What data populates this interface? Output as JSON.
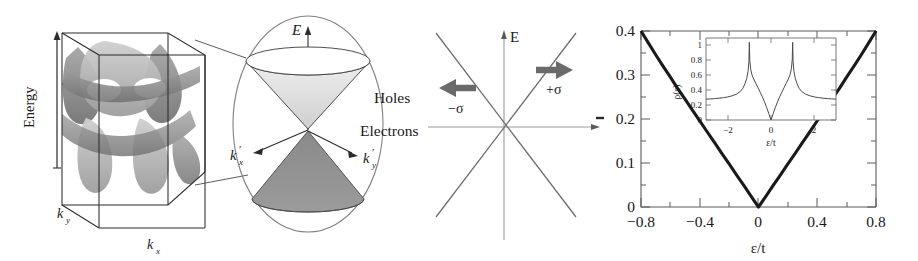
{
  "figure": {
    "panels": [
      {
        "id": "brillouin-zone",
        "axis_energy": "Energy",
        "axis_kx": "k",
        "axis_kx_sub": "x",
        "axis_ky": "k",
        "axis_ky_sub": "y"
      },
      {
        "id": "dirac-cone",
        "axis_E": "E",
        "label_holes": "Holes",
        "label_electrons": "Electrons",
        "axis_kxp": "k",
        "axis_kxp_sup": "'",
        "axis_kxp_sub": "x",
        "axis_kyp": "k",
        "axis_kyp_sup": "'",
        "axis_kyp_sub": "y"
      },
      {
        "id": "dirac-dispersion",
        "axis_E": "E",
        "label_plus_sigma": "+σ",
        "label_minus_sigma": "−σ"
      },
      {
        "id": "density-of-states"
      }
    ]
  },
  "panel_bz": {
    "energy_label": "Energy",
    "kx_label": "k",
    "kx_sub": "x",
    "ky_label": "k",
    "ky_sub": "y",
    "surface_fill_light": "#b9b9b9",
    "surface_fill_dark": "#8a8a8a",
    "box_stroke": "#2b2b2b"
  },
  "panel_cone": {
    "E_label": "E",
    "holes_label": "Holes",
    "electrons_label": "Electrons",
    "kxp_label": "k",
    "kxp_sup": "′",
    "kxp_sub": "x",
    "kyp_label": "k",
    "kyp_sup": "′",
    "kyp_sub": "y",
    "upper_cone_fill": "#dcdcdc",
    "lower_cone_fill": "#8d8d8d",
    "ellipse_stroke": "#777777"
  },
  "panel_dirac": {
    "E_label": "E",
    "plus_sigma_label": "+σ",
    "minus_sigma_label": "−σ",
    "arrow_fill": "#6a6a6a",
    "band_stroke": "#6f6f6f",
    "axis_stroke": "#9a9a9a"
  },
  "panel_dos": {
    "xlabel": "ε/t",
    "ylabel_clipped": "–",
    "x_ticks": [
      "−0.8",
      "−0.4",
      "0",
      "0.4",
      "0.8"
    ],
    "y_ticks": [
      "0",
      "0.1",
      "0.2",
      "0.3",
      "0.4"
    ],
    "inset": {
      "xlabel": "ε/t",
      "ylabel": "ρ(ε)",
      "x_ticks": [
        "−2",
        "0",
        "2"
      ],
      "y_ticks": [
        "0",
        "0.2",
        "0.4",
        "0.6",
        "0.8",
        "1"
      ]
    }
  },
  "chart_data": [
    {
      "type": "line",
      "id": "dos-main",
      "title": "",
      "xlabel": "ε/t",
      "ylabel": "ρ(ε)",
      "xlim": [
        -0.8,
        0.8
      ],
      "ylim": [
        0.0,
        0.4
      ],
      "xticks": [
        -0.8,
        -0.4,
        0,
        0.4,
        0.8
      ],
      "yticks": [
        0,
        0.1,
        0.2,
        0.3,
        0.4
      ],
      "grid": false,
      "legend": "none",
      "series": [
        {
          "name": "ρ(ε) linear Dirac DOS",
          "x": [
            -0.8,
            -0.75,
            -0.7,
            -0.65,
            -0.6,
            -0.55,
            -0.5,
            -0.45,
            -0.4,
            -0.35,
            -0.3,
            -0.25,
            -0.2,
            -0.15,
            -0.1,
            -0.05,
            0.0,
            0.05,
            0.1,
            0.15,
            0.2,
            0.25,
            0.3,
            0.35,
            0.4,
            0.45,
            0.5,
            0.55,
            0.6,
            0.65,
            0.7,
            0.75,
            0.8
          ],
          "y": [
            0.4,
            0.373,
            0.346,
            0.32,
            0.295,
            0.269,
            0.245,
            0.22,
            0.196,
            0.171,
            0.147,
            0.122,
            0.098,
            0.073,
            0.049,
            0.024,
            0.0,
            0.024,
            0.049,
            0.073,
            0.098,
            0.122,
            0.147,
            0.171,
            0.196,
            0.22,
            0.245,
            0.269,
            0.295,
            0.32,
            0.346,
            0.373,
            0.4
          ]
        }
      ]
    },
    {
      "type": "line",
      "id": "dos-inset",
      "title": "",
      "xlabel": "ε/t",
      "ylabel": "ρ(ε)",
      "xlim": [
        -3.0,
        3.0
      ],
      "ylim": [
        0.0,
        1.12
      ],
      "xticks": [
        -2,
        0,
        2
      ],
      "yticks": [
        0,
        0.2,
        0.4,
        0.6,
        0.8,
        1.0
      ],
      "grid": false,
      "legend": "none",
      "annotations": [
        "van Hove singularities at ε/t = ±1"
      ],
      "series": [
        {
          "name": "ρ(ε) full band DOS",
          "x": [
            -3.0,
            -2.8,
            -2.6,
            -2.4,
            -2.2,
            -2.0,
            -1.8,
            -1.6,
            -1.4,
            -1.3,
            -1.2,
            -1.12,
            -1.06,
            -1.02,
            -1.0,
            -0.98,
            -0.94,
            -0.88,
            -0.8,
            -0.7,
            -0.6,
            -0.5,
            -0.4,
            -0.3,
            -0.2,
            -0.1,
            0.0,
            0.1,
            0.2,
            0.3,
            0.4,
            0.5,
            0.6,
            0.7,
            0.8,
            0.88,
            0.94,
            0.98,
            1.0,
            1.02,
            1.06,
            1.12,
            1.2,
            1.3,
            1.4,
            1.6,
            1.8,
            2.0,
            2.2,
            2.4,
            2.6,
            2.8,
            3.0
          ],
          "y": [
            0.285,
            0.288,
            0.292,
            0.298,
            0.305,
            0.315,
            0.33,
            0.352,
            0.395,
            0.432,
            0.495,
            0.57,
            0.66,
            0.8,
            1.06,
            0.82,
            0.7,
            0.62,
            0.56,
            0.5,
            0.44,
            0.38,
            0.318,
            0.248,
            0.17,
            0.086,
            0.0,
            0.086,
            0.17,
            0.248,
            0.318,
            0.38,
            0.44,
            0.5,
            0.56,
            0.62,
            0.7,
            0.82,
            1.06,
            0.8,
            0.66,
            0.57,
            0.495,
            0.432,
            0.395,
            0.352,
            0.33,
            0.315,
            0.305,
            0.298,
            0.292,
            0.288,
            0.285
          ]
        }
      ]
    }
  ]
}
